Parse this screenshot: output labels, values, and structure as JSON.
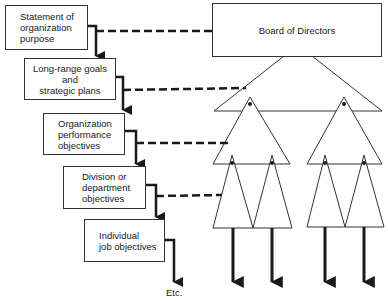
{
  "diagram": {
    "board": {
      "label": "Board of Directors"
    },
    "hierarchy_boxes": [
      {
        "label": "Statement of\norganization\npurpose"
      },
      {
        "label": "Long-range goals\nand\nstrategic plans"
      },
      {
        "label": "Organization\nperformance\nobjectives"
      },
      {
        "label": "Division or\ndepartment\nobjectives"
      },
      {
        "label": "Individual\njob objectives"
      }
    ],
    "terminal_label": "Etc.",
    "colors": {
      "line": "#1a1a1a",
      "box_border": "#333333",
      "background": "#ffffff"
    }
  }
}
